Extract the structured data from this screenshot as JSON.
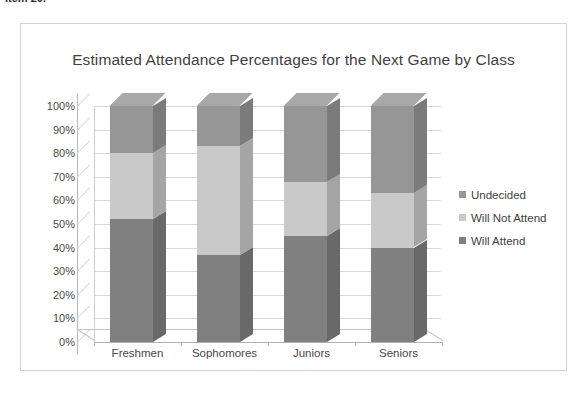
{
  "caption": {
    "text": "Item 20."
  },
  "chart_frame": {
    "border_color": "#d3d3d3"
  },
  "legend": {
    "position": "right",
    "items": [
      {
        "label": "Undecided",
        "color": "#969696"
      },
      {
        "label": "Will Not Attend",
        "color": "#c9c9c9"
      },
      {
        "label": "Will Attend",
        "color": "#808080"
      }
    ]
  },
  "chart_data": {
    "type": "bar",
    "subtype": "stacked-column-3d",
    "title": "Estimated Attendance Percentages for the Next Game by Class",
    "xlabel": "",
    "ylabel": "",
    "ylim": [
      0,
      100
    ],
    "ytick_labels": [
      "100%",
      "90%",
      "80%",
      "70%",
      "60%",
      "50%",
      "40%",
      "30%",
      "20%",
      "10%",
      "0%"
    ],
    "ytick_values": [
      100,
      90,
      80,
      70,
      60,
      50,
      40,
      30,
      20,
      10,
      0
    ],
    "grid": true,
    "categories": [
      "Freshmen",
      "Sophomores",
      "Juniors",
      "Seniors"
    ],
    "series": [
      {
        "name": "Will Attend",
        "color": "#808080",
        "values": [
          52,
          37,
          45,
          40
        ]
      },
      {
        "name": "Will Not Attend",
        "color": "#c9c9c9",
        "values": [
          28,
          46,
          23,
          23
        ]
      },
      {
        "name": "Undecided",
        "color": "#969696",
        "values": [
          20,
          17,
          32,
          37
        ]
      }
    ],
    "stack_totals": [
      100,
      100,
      100,
      100
    ],
    "units": "percent",
    "annotations": []
  }
}
